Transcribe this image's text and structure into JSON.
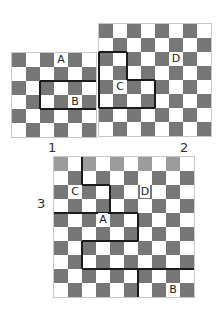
{
  "figure": {
    "cell_size": 14,
    "colors": {
      "dark": "#777777",
      "faded_dark": "#9c9c9c",
      "light": "#ffffff",
      "line": "#1a1a1a"
    },
    "boards": [
      {
        "label": "1",
        "size": 6,
        "origin": [
          12,
          53
        ],
        "label_pos": [
          48,
          140
        ],
        "faded_rows": [],
        "letters": [
          {
            "text": "A",
            "row": 0,
            "col": 3
          },
          {
            "text": "B",
            "row": 3,
            "col": 4
          }
        ],
        "hlines": [
          [
            2,
            2,
            6
          ],
          [
            4,
            2,
            6
          ]
        ],
        "vlines": [
          [
            2,
            2,
            4
          ]
        ]
      },
      {
        "label": "2",
        "size": 8,
        "origin": [
          99,
          24
        ],
        "label_pos": [
          180,
          140
        ],
        "faded_rows": [],
        "letters": [
          {
            "text": "D",
            "row": 2,
            "col": 5
          },
          {
            "text": "C",
            "row": 4,
            "col": 1
          }
        ],
        "hlines": [
          [
            2,
            0,
            2
          ],
          [
            4,
            2,
            4
          ],
          [
            6,
            0,
            4
          ]
        ],
        "vlines": [
          [
            0,
            2,
            6
          ],
          [
            2,
            2,
            4
          ],
          [
            4,
            4,
            6
          ]
        ]
      },
      {
        "label": "3",
        "size": 10,
        "origin": [
          54,
          157
        ],
        "label_pos": [
          37,
          196
        ],
        "faded_rows": [
          0
        ],
        "letters": [
          {
            "text": "C",
            "row": 2,
            "col": 1
          },
          {
            "text": "D",
            "row": 2,
            "col": 6
          },
          {
            "text": "A",
            "row": 4,
            "col": 3
          },
          {
            "text": "B",
            "row": 9,
            "col": 8
          }
        ],
        "hlines": [
          [
            2,
            2,
            4
          ],
          [
            4,
            0,
            6
          ],
          [
            6,
            2,
            6
          ],
          [
            8,
            2,
            10
          ]
        ],
        "vlines": [
          [
            2,
            0,
            2
          ],
          [
            4,
            2,
            4
          ],
          [
            6,
            4,
            6
          ],
          [
            2,
            6,
            8
          ],
          [
            6,
            8,
            10
          ]
        ]
      }
    ]
  }
}
